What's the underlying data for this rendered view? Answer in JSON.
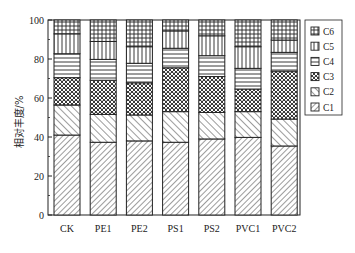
{
  "chart_data": {
    "type": "bar",
    "stacked": true,
    "title": "",
    "xlabel": "",
    "ylabel": "相对丰度/%",
    "ylim": [
      0,
      100
    ],
    "yticks": [
      0,
      20,
      40,
      60,
      80,
      100
    ],
    "grid": false,
    "legend_position": "right",
    "categories": [
      "CK",
      "PE1",
      "PE2",
      "PS1",
      "PS2",
      "PVC1",
      "PVC2"
    ],
    "series": [
      {
        "name": "C1",
        "pattern": "dense-diagonal-up",
        "values": [
          41.0,
          37.3,
          38.0,
          37.3,
          39.0,
          39.8,
          35.4
        ]
      },
      {
        "name": "C2",
        "pattern": "diagonal-down",
        "values": [
          15.4,
          14.3,
          13.3,
          15.7,
          13.6,
          13.2,
          13.8
        ]
      },
      {
        "name": "C3",
        "pattern": "cross-dots",
        "values": [
          14.0,
          17.5,
          16.5,
          22.5,
          18.4,
          11.6,
          24.6
        ]
      },
      {
        "name": "C4",
        "pattern": "horizontal-lines",
        "values": [
          12.3,
          10.7,
          10.0,
          10.0,
          10.7,
          10.6,
          9.6
        ]
      },
      {
        "name": "C5",
        "pattern": "vertical-lines",
        "values": [
          10.2,
          9.2,
          8.5,
          8.9,
          10.2,
          11.1,
          6.3
        ]
      },
      {
        "name": "C6",
        "pattern": "grid",
        "values": [
          7.1,
          11.0,
          13.7,
          5.6,
          8.1,
          13.7,
          10.3
        ]
      }
    ],
    "legend_order": [
      "C6",
      "C5",
      "C4",
      "C3",
      "C2",
      "C1"
    ]
  },
  "colors": {
    "ink": "#222222",
    "background": "#ffffff"
  }
}
